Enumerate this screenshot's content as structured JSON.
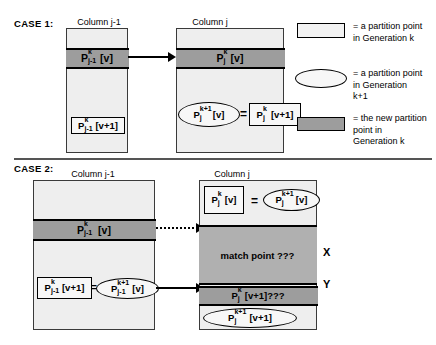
{
  "case1": {
    "label": "CASE 1:",
    "left_column_title": "Column j-1",
    "right_column_title": "Column j",
    "left_band_label": "P",
    "left_band_sup": "k",
    "left_band_sub": "j-1",
    "left_band_tail": "[v]",
    "left_box_label": "P",
    "left_box_sup": "k",
    "left_box_sub": "j-1",
    "left_box_tail": "[v+1]",
    "right_band_label": "P",
    "right_band_sup": "k",
    "right_band_sub": "j",
    "right_band_tail": "[v]",
    "right_ellipse_label": "P",
    "right_ellipse_sup": "k+1",
    "right_ellipse_sub": "j",
    "right_ellipse_tail": "[v]",
    "equals": "=",
    "right_box_label": "P",
    "right_box_sup": "k",
    "right_box_sub": "j",
    "right_box_tail": "[v+1]"
  },
  "case2": {
    "label": "CASE 2:",
    "left_column_title": "Column j-1",
    "right_column_title": "Column j",
    "left_band_label": "P",
    "left_band_sup": "k",
    "left_band_sub": "j-1",
    "left_band_tail": "[v]",
    "left_box_label": "P",
    "left_box_sup": "k",
    "left_box_sub": "j-1",
    "left_box_tail": "[v+1]",
    "left_eq": "=",
    "left_ellipse_label": "P",
    "left_ellipse_sup": "k+1",
    "left_ellipse_sub": "j-1",
    "left_ellipse_tail": "[v]",
    "top_box_label": "P",
    "top_box_sup": "k",
    "top_box_sub": "j",
    "top_box_tail": "[v]",
    "top_eq": "=",
    "top_ellipse_label": "P",
    "top_ellipse_sup": "k+1",
    "top_ellipse_sub": "j",
    "top_ellipse_tail": "[v]",
    "match_point_text": "match point ???",
    "x_label": "X",
    "y_label": "Y",
    "y_band_label": "P",
    "y_band_sup": "k",
    "y_band_sub": "j",
    "y_band_tail": "[v+1]???",
    "bottom_ellipse_label": "P",
    "bottom_ellipse_sup": "k+1",
    "bottom_ellipse_sub": "j",
    "bottom_ellipse_tail": "[v+1]"
  },
  "legend": {
    "item1_text": "= a partition point\nin Generation k",
    "item2_text": "= a partition point\nin Generation\nk+1",
    "item3_text": "= the new partition\npoint  in\nGeneration k"
  },
  "colors": {
    "column_fill": "#eeeeee",
    "dark_band": "#9d9d9d",
    "match_region": "#b0b0b0",
    "box_fill": "#f7f7f7",
    "stroke": "#000000"
  }
}
